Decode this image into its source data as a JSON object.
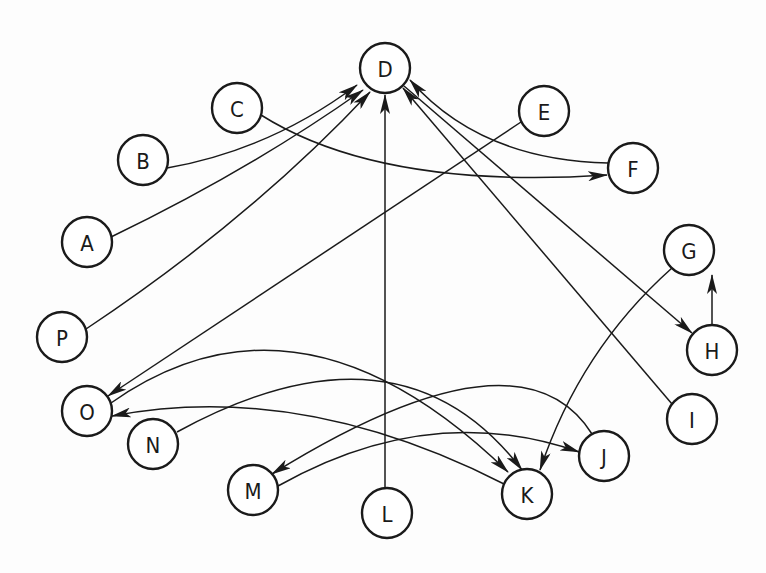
{
  "diagram": {
    "type": "directed-graph",
    "node_radius": 25,
    "colors": {
      "stroke": "#1a1a1a",
      "background": "#fdfdfd"
    },
    "nodes": [
      {
        "id": "D",
        "label": "D",
        "x": 385,
        "y": 68
      },
      {
        "id": "C",
        "label": "C",
        "x": 237,
        "y": 108
      },
      {
        "id": "B",
        "label": "B",
        "x": 143,
        "y": 160
      },
      {
        "id": "A",
        "label": "A",
        "x": 87,
        "y": 242
      },
      {
        "id": "P",
        "label": "P",
        "x": 62,
        "y": 337
      },
      {
        "id": "O",
        "label": "O",
        "x": 87,
        "y": 411
      },
      {
        "id": "N",
        "label": "N",
        "x": 153,
        "y": 444
      },
      {
        "id": "M",
        "label": "M",
        "x": 253,
        "y": 490
      },
      {
        "id": "L",
        "label": "L",
        "x": 387,
        "y": 513
      },
      {
        "id": "K",
        "label": "K",
        "x": 527,
        "y": 494
      },
      {
        "id": "J",
        "label": "J",
        "x": 604,
        "y": 456
      },
      {
        "id": "I",
        "label": "I",
        "x": 692,
        "y": 419
      },
      {
        "id": "H",
        "label": "H",
        "x": 712,
        "y": 350
      },
      {
        "id": "G",
        "label": "G",
        "x": 689,
        "y": 250
      },
      {
        "id": "F",
        "label": "F",
        "x": 633,
        "y": 168
      },
      {
        "id": "E",
        "label": "E",
        "x": 544,
        "y": 111
      }
    ],
    "edges": [
      {
        "from": "B",
        "to": "D",
        "path": "M167,168 Q270,150 357,85"
      },
      {
        "from": "A",
        "to": "D",
        "path": "M111,237 Q250,170 363,90"
      },
      {
        "from": "P",
        "to": "D",
        "path": "M86,329 Q250,220 370,92"
      },
      {
        "from": "L",
        "to": "D",
        "path": "M385,488 L385,95"
      },
      {
        "from": "F",
        "to": "D",
        "path": "M608,163 Q480,160 410,80"
      },
      {
        "from": "I",
        "to": "D",
        "path": "M672,404 L403,88"
      },
      {
        "from": "C",
        "to": "F",
        "path": "M261,115 Q380,190 607,175"
      },
      {
        "from": "D",
        "to": "H",
        "path": "M404,86 L692,333"
      },
      {
        "from": "H",
        "to": "G",
        "path": "M712,325 L712,275"
      },
      {
        "from": "E",
        "to": "O",
        "path": "M521,122 L108,396"
      },
      {
        "from": "G",
        "to": "K",
        "path": "M672,268 Q580,350 540,470"
      },
      {
        "from": "O",
        "to": "K",
        "path": "M111,403 Q300,270 508,472"
      },
      {
        "from": "N",
        "to": "K",
        "path": "M177,432 Q400,310 522,470"
      },
      {
        "from": "K",
        "to": "O",
        "path": "M504,484 Q300,380 112,416"
      },
      {
        "from": "J",
        "to": "M",
        "path": "M592,434 Q520,320 272,474"
      },
      {
        "from": "M",
        "to": "J",
        "path": "M278,486 Q430,400 579,452"
      }
    ]
  }
}
